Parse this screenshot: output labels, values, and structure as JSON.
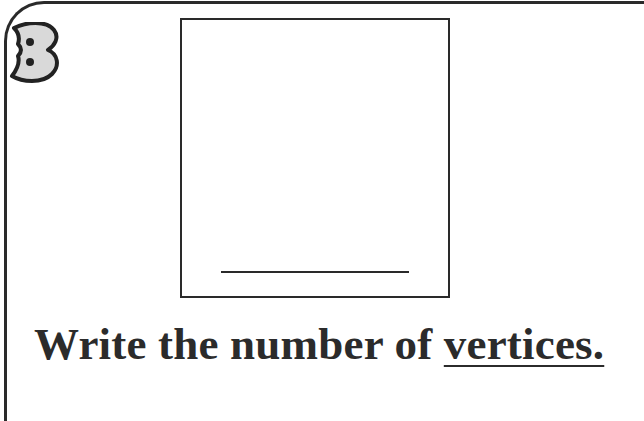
{
  "question": {
    "number": "3",
    "prompt_prefix": "Write the number of ",
    "prompt_emphasis": "vertices.",
    "shape": "square",
    "answer_value": ""
  },
  "colors": {
    "ink": "#2a2a2a",
    "badge_fill": "#d9d9d9",
    "background": "#ffffff"
  }
}
